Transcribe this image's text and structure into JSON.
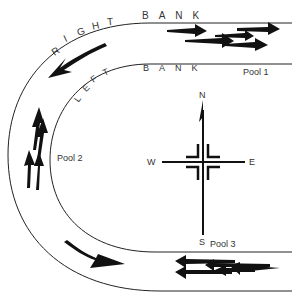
{
  "diagram": {
    "banks": {
      "right_bank": "RIGHT BANK",
      "left_bank": "LEFT BANK"
    },
    "pools": [
      {
        "label": "Pool 1",
        "fish_count": 5,
        "fish_direction": "east"
      },
      {
        "label": "Pool 2",
        "fish_count": 4,
        "fish_direction": "north"
      },
      {
        "label": "Pool 3",
        "fish_count": 5,
        "fish_direction": "west"
      }
    ],
    "flow_arrows": [
      {
        "location": "upper bend",
        "direction": "downstream-southwest"
      },
      {
        "location": "lower bend",
        "direction": "downstream-east"
      }
    ],
    "compass": {
      "n": "N",
      "s": "S",
      "e": "E",
      "w": "W"
    },
    "colors": {
      "ink": "#111111",
      "background": "#ffffff"
    }
  }
}
